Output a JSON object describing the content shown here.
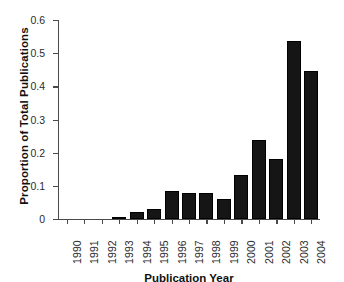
{
  "chart_data": {
    "type": "bar",
    "title": "",
    "xlabel": "Publication Year",
    "ylabel": "Proportion of Total Publications",
    "categories": [
      "1990",
      "1991",
      "1992",
      "1993",
      "1994",
      "1995",
      "1996",
      "1997",
      "1998",
      "1999",
      "2000",
      "2001",
      "2002",
      "2003",
      "2004"
    ],
    "values": [
      0,
      0,
      0,
      0.005,
      0.021,
      0.03,
      0.083,
      0.079,
      0.077,
      0.059,
      0.133,
      0.239,
      0.182,
      0.537,
      0.447
    ],
    "ylim": [
      0,
      0.6
    ],
    "yticks": [
      0,
      0.1,
      0.2,
      0.3,
      0.4,
      0.5,
      0.6
    ],
    "ytick_labels": [
      "0",
      "0.1",
      "0.2",
      "0.3",
      "0.4",
      "0.5",
      "0.6"
    ],
    "grid": false,
    "legend": null,
    "bar_color": "#151515",
    "axis_color": "#4a4a4a"
  }
}
